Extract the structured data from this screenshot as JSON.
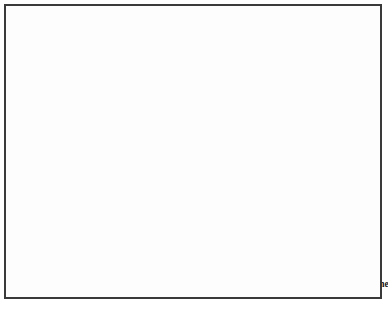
{
  "chart_data": {
    "type": "line",
    "title": "",
    "subtitle": "",
    "xlabel": "",
    "ylabel": "",
    "ylim": [
      0,
      320
    ],
    "yticks": [
      0,
      50,
      100,
      150,
      200,
      250,
      300
    ],
    "grid": true,
    "legend_position": "bottom",
    "categories": [
      "2004",
      "2005",
      "2006",
      "2007",
      "2008",
      "2009",
      "2010",
      "2011",
      "2012",
      "2013",
      "2014",
      "2015",
      "2016",
      "2017",
      "2018",
      "2019",
      "2020"
    ],
    "series": [
      {
        "name": "1 Stern",
        "color": "#d4d4d4",
        "stroke": "#8c8c8c",
        "marker": "circle-open",
        "values": [
          76,
          76,
          81,
          89,
          113,
          110,
          120,
          128,
          141,
          149,
          166,
          182,
          205,
          221,
          255,
          262,
          254
        ]
      },
      {
        "name": "2 Sterne",
        "color": "#8a8a8a",
        "stroke": "#8a8a8a",
        "marker": "circle",
        "values": [
          14,
          17,
          17,
          17,
          17,
          19,
          20,
          22,
          31,
          35,
          36,
          35,
          36,
          37,
          37,
          36,
          43
        ]
      },
      {
        "name": "3 Sterne",
        "color": "#141414",
        "stroke": "#141414",
        "marker": "circle",
        "values": [
          5,
          5,
          6,
          6,
          7,
          7,
          8,
          8,
          9,
          10,
          10,
          10,
          10,
          10,
          10,
          10,
          10
        ]
      },
      {
        "name": "Gesamtzahl Sterne",
        "color": "#6b6b6b",
        "stroke": "#9a9a9a",
        "marker": "circle",
        "values": [
          95,
          98,
          107,
          112,
          142,
          142,
          152,
          161,
          184,
          196,
          217,
          230,
          253,
          270,
          305,
          312,
          303
        ]
      }
    ],
    "annotations": [
      {
        "text": "95",
        "series": "Gesamtzahl Sterne",
        "category": "2004",
        "dx": 0,
        "dy": -13
      },
      {
        "text": "76",
        "series": "1 Stern",
        "category": "2004",
        "dx": 2,
        "dy": 15
      },
      {
        "text": "14",
        "series": "2 Sterne",
        "category": "2004",
        "dx": 0,
        "dy": -12
      },
      {
        "text": "5",
        "series": "3 Sterne",
        "category": "2004",
        "dx": -9,
        "dy": 11
      },
      {
        "text": "307",
        "series": "Gesamtzahl Sterne",
        "category": "2019",
        "dx": 18,
        "dy": -12
      },
      {
        "text": "254",
        "series": "1 Stern",
        "category": "2020",
        "dx": -2,
        "dy": 16
      },
      {
        "text": "43",
        "series": "2 Sterne",
        "category": "2020",
        "dx": 0,
        "dy": -12
      },
      {
        "text": "10",
        "series": "3 Sterne",
        "category": "2020",
        "dx": 9,
        "dy": -10
      }
    ]
  }
}
